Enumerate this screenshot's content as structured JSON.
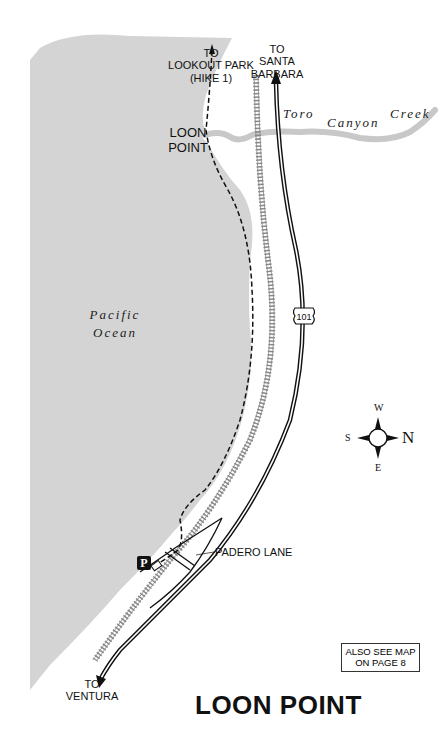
{
  "map": {
    "title": "LOON POINT",
    "note": {
      "line1": "ALSO SEE MAP",
      "line2": "ON PAGE 8"
    },
    "labels": {
      "lookout": {
        "line1": "TO",
        "line2": "LOOKOUT PARK",
        "line3": "(HIKE 1)"
      },
      "santa_barbara": {
        "line1": "TO",
        "line2": "SANTA",
        "line3": "BARBARA"
      },
      "loon_point": {
        "line1": "LOON",
        "line2": "POINT"
      },
      "creek": "Toro Canyon Creek",
      "ocean": {
        "line1": "Pacific",
        "line2": "Ocean"
      },
      "highway_shield": "101",
      "padero_lane": "PADERO LANE",
      "ventura": {
        "line1": "TO",
        "line2": "VENTURA"
      },
      "parking": "P"
    },
    "compass": {
      "north": "N",
      "south": "S",
      "east": "E",
      "west": "W"
    },
    "colors": {
      "ocean": "#d4d4d4",
      "creek": "#c8c8c8",
      "ink": "#111111",
      "rail": "#888888"
    }
  }
}
